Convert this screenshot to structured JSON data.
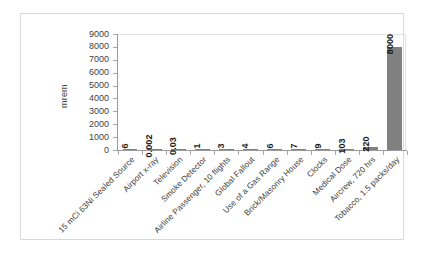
{
  "chart_data": {
    "type": "bar",
    "title": "",
    "xlabel": "",
    "ylabel": "mrem",
    "ylim": [
      0,
      9000
    ],
    "ytick_labels": [
      "9000",
      "8000",
      "7000",
      "6000",
      "5000",
      "4000",
      "3000",
      "2000",
      "1000",
      "0"
    ],
    "ytick_values": [
      9000,
      8000,
      7000,
      6000,
      5000,
      4000,
      3000,
      2000,
      1000,
      0
    ],
    "grid": false,
    "legend": "none",
    "categories": [
      "15 mCi 63Ni Sealed Source",
      "Airport x-ray",
      "Television",
      "Smoke Detector",
      "Airline Passenger, 10 flights",
      "Global Fallout",
      "Use of a Gas Range",
      "Brick/Masonry House",
      "Clocks",
      "Medical Dose",
      "Aircrew, 720 hrs",
      "Tobacco, 1.5 packs/day"
    ],
    "values": [
      6,
      0.002,
      0.03,
      1,
      3,
      4,
      6,
      7,
      9,
      103,
      220,
      8000
    ],
    "value_labels": [
      "6",
      "0.002",
      "0.03",
      "1",
      "3",
      "4",
      "6",
      "7",
      "9",
      "103",
      "220",
      "8000"
    ],
    "bar_color": "#808080",
    "axis_color": "#9a9a9a",
    "text_color": "#3f3f3f",
    "background": "#ffffff"
  }
}
